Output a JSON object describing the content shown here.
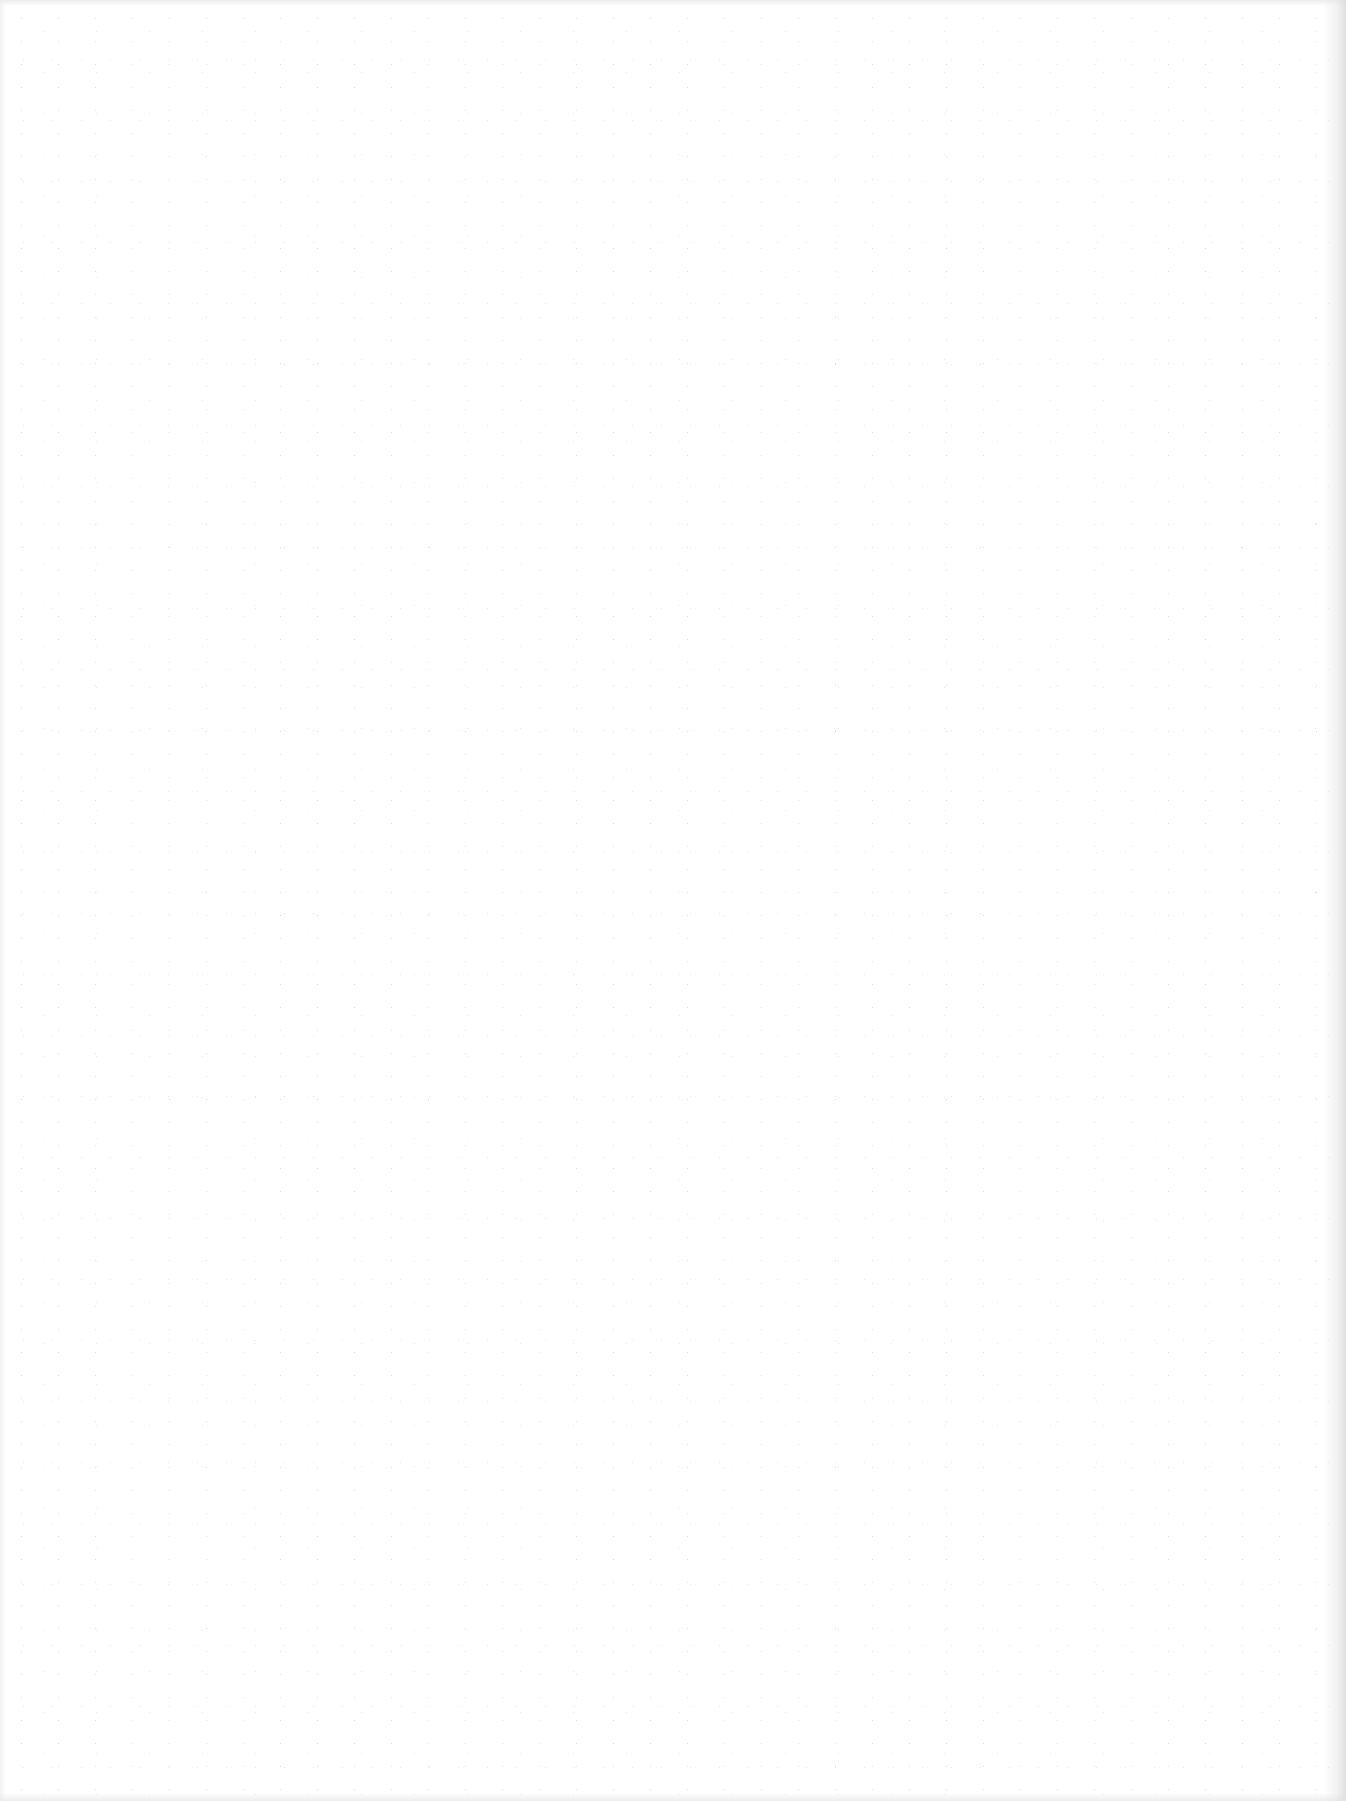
{
  "page": {
    "kind": "blank-scanned-page",
    "background_color": "#ffffff",
    "edge_shadow_color": "#d7d7d7",
    "noise_color": "#a0a0a0",
    "text_content": []
  }
}
